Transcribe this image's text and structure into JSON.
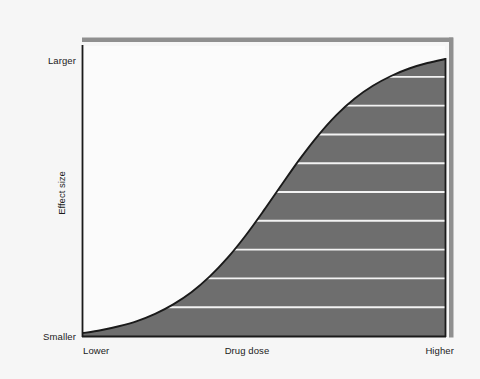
{
  "figure": {
    "background_color": "#f6f6f6",
    "fill_color": "#6e6e6e",
    "outline_color": "#1a1a1a",
    "gridline_color": "#f2f2f2",
    "shadow_color": "#8f8f8f"
  },
  "labels": {
    "y_top": "Larger",
    "y_bottom": "Smaller",
    "y_title": "Effect size",
    "x_left": "Lower",
    "x_title": "Drug dose",
    "x_right": "Higher"
  },
  "chart_data": {
    "type": "area",
    "title": "",
    "subtitle": "",
    "xlabel": "Drug dose",
    "ylabel": "Effect size",
    "xlim": [
      0,
      1
    ],
    "ylim": [
      0,
      1
    ],
    "xtick_labels": [
      "Lower",
      "Higher"
    ],
    "ytick_labels": [
      "Smaller",
      "Larger"
    ],
    "grid": true,
    "grid_orientation": "horizontal",
    "grid_line_count": 9,
    "grid_levels": [
      0.1,
      0.2,
      0.3,
      0.4,
      0.5,
      0.6,
      0.7,
      0.8,
      0.9
    ],
    "legend": null,
    "annotations": [],
    "series": [
      {
        "name": "Dose-response curve",
        "shape": "sigmoid",
        "fill": true,
        "x": [
          0.0,
          0.05,
          0.1,
          0.15,
          0.2,
          0.25,
          0.3,
          0.35,
          0.4,
          0.45,
          0.5,
          0.55,
          0.6,
          0.65,
          0.7,
          0.75,
          0.8,
          0.85,
          0.9,
          0.95,
          1.0
        ],
        "y": [
          0.01,
          0.02,
          0.034,
          0.052,
          0.077,
          0.11,
          0.152,
          0.206,
          0.272,
          0.35,
          0.437,
          0.528,
          0.617,
          0.698,
          0.768,
          0.825,
          0.869,
          0.903,
          0.929,
          0.948,
          0.962
        ]
      }
    ]
  }
}
